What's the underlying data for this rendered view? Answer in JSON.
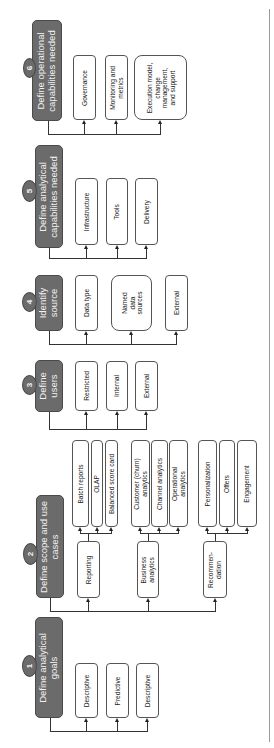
{
  "diagram": {
    "orientation": "rotated-90-ccw",
    "colors": {
      "header_fill": "#6b6b6b",
      "header_text": "#f2f2f2",
      "child_border": "#555555",
      "connector": "#333333"
    },
    "steps": [
      {
        "number": "1",
        "title": "Define analytical goals",
        "children": [
          {
            "label": "Descriptive"
          },
          {
            "label": "Predictive"
          },
          {
            "label": "Descriptive"
          }
        ]
      },
      {
        "number": "2",
        "title": "Define scope and use cases",
        "children": [
          {
            "label": "Reporting",
            "children": [
              {
                "label": "Batch reports"
              },
              {
                "label": "OLAP"
              },
              {
                "label": "Balanced score card"
              }
            ]
          },
          {
            "label": "Business analytics",
            "children": [
              {
                "label": "Customer (churn) analytics"
              },
              {
                "label": "Channel analytics"
              },
              {
                "label": "Operational analytics"
              }
            ]
          },
          {
            "label": "Recommen-dation",
            "children": [
              {
                "label": "Personalization"
              },
              {
                "label": "Offers"
              },
              {
                "label": "Engagement"
              }
            ]
          }
        ]
      },
      {
        "number": "3",
        "title": "Define users",
        "children": [
          {
            "label": "Restricted"
          },
          {
            "label": "Internal"
          },
          {
            "label": "External"
          }
        ]
      },
      {
        "number": "4",
        "title": "Identify source",
        "children": [
          {
            "label": "Data type"
          },
          {
            "label": "Named data sources"
          },
          {
            "label": "External"
          }
        ]
      },
      {
        "number": "5",
        "title": "Define analytical capabilities needed",
        "children": [
          {
            "label": "Infrastructure"
          },
          {
            "label": "Tools"
          },
          {
            "label": "Delivery"
          }
        ]
      },
      {
        "number": "6",
        "title": "Define operational capabilities needed",
        "children": [
          {
            "label": "Governance"
          },
          {
            "label": "Monitoring and metrics"
          },
          {
            "label": "Execution model, change management, and support"
          }
        ]
      }
    ]
  }
}
